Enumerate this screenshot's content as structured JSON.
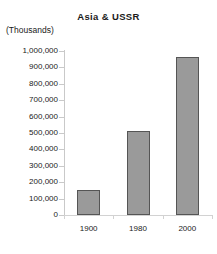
{
  "chart_data": {
    "type": "bar",
    "title": "Asia & USSR",
    "units_label": "(Thousands)",
    "xlabel": "",
    "ylabel": "",
    "categories": [
      "1900",
      "1980",
      "2000"
    ],
    "values": [
      155000,
      515000,
      965000
    ],
    "ylim": [
      0,
      1000000
    ],
    "ytick_values": [
      0,
      100000,
      200000,
      300000,
      400000,
      500000,
      600000,
      700000,
      800000,
      900000,
      1000000
    ],
    "ytick_labels": [
      "0",
      "100,000",
      "200,000",
      "300,000",
      "400,000",
      "500,000",
      "600,000",
      "700,000",
      "800,000",
      "900,000",
      "1,000,000"
    ],
    "grid": false,
    "legend": "none",
    "bar_color": "#9a9a9a",
    "bar_border_color": "#555555",
    "axis_color": "#c9c9c9",
    "background": "#ffffff"
  }
}
